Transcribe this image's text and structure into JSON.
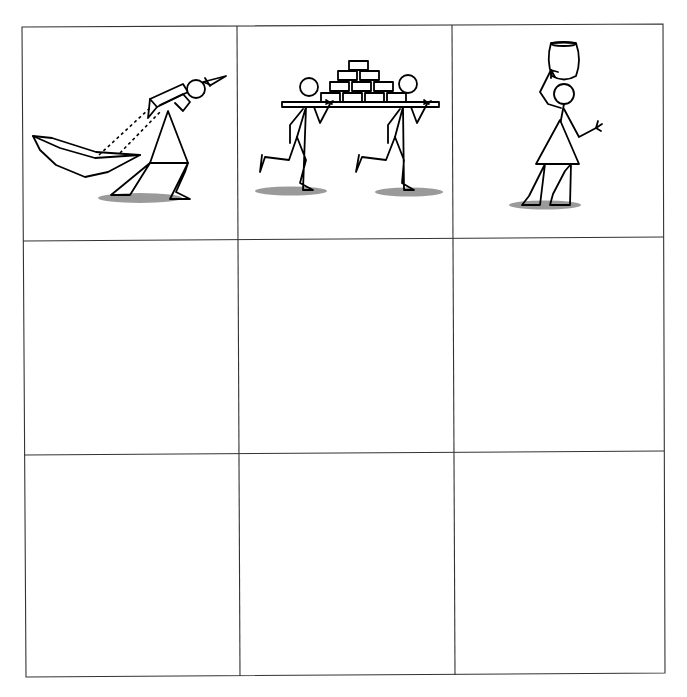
{
  "worksheet": {
    "layout": "3x3 grid",
    "rows": 3,
    "cols": 3,
    "colors": {
      "grid_line": "#333333",
      "figure_stroke": "#000000",
      "shadow": "#9a9a9a",
      "background": "#ffffff"
    },
    "cells": [
      {
        "row": 1,
        "col": 1,
        "content": "stick figure pulling a boat with two ropes over shoulder",
        "icon": "figure-pulling-boat"
      },
      {
        "row": 1,
        "col": 2,
        "content": "two stick figures running carrying a plank stacked with bricks (pyramid 1-2-3-4)",
        "icon": "figures-carrying-bricks"
      },
      {
        "row": 1,
        "col": 3,
        "content": "stick figure woman walking with a pot balanced on head",
        "icon": "figure-carrying-pot"
      },
      {
        "row": 2,
        "col": 1,
        "content": "",
        "icon": "empty-cell"
      },
      {
        "row": 2,
        "col": 2,
        "content": "",
        "icon": "empty-cell"
      },
      {
        "row": 2,
        "col": 3,
        "content": "",
        "icon": "empty-cell"
      },
      {
        "row": 3,
        "col": 1,
        "content": "",
        "icon": "empty-cell"
      },
      {
        "row": 3,
        "col": 2,
        "content": "",
        "icon": "empty-cell"
      },
      {
        "row": 3,
        "col": 3,
        "content": "",
        "icon": "empty-cell"
      }
    ]
  }
}
